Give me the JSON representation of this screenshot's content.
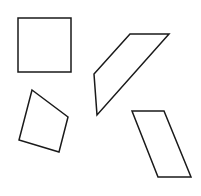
{
  "canvas": {
    "width": 201,
    "height": 196,
    "background": "#ffffff"
  },
  "style": {
    "stroke": "#1a1a1a",
    "stroke_width": 1.5,
    "fill": "none"
  },
  "shapes": [
    {
      "name": "square",
      "points": "18,18 71,18 71,72 18,72"
    },
    {
      "name": "slanted-quadrilateral",
      "points": "130,34 169,34 97,115 94,74"
    },
    {
      "name": "kite-quadrilateral",
      "points": "32,90 68,117 59,152 19,140"
    },
    {
      "name": "parallelogram",
      "points": "132,111 164,111 191,177 158,177"
    }
  ]
}
